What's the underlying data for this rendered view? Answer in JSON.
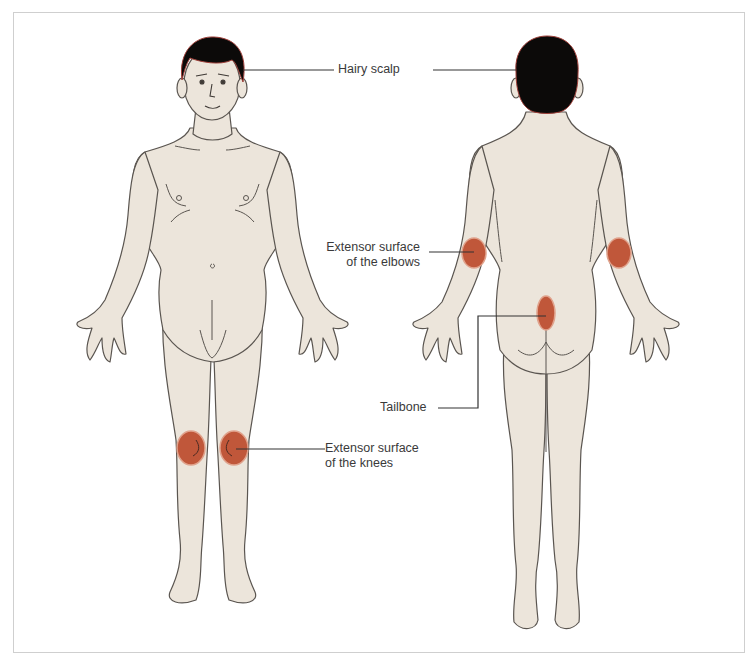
{
  "diagram": {
    "views": [
      {
        "id": "front",
        "name": "Front view"
      },
      {
        "id": "back",
        "name": "Back view"
      }
    ],
    "colors": {
      "skin": "#ece5db",
      "outline": "#5a5550",
      "hair": "#0c0a09",
      "hair_edge": "#a0403a",
      "lesion": "#c0573a",
      "lesion_edge": "#e0a28c",
      "leader": "#333333",
      "text": "#3a3a3a",
      "border": "#cfcfcf"
    },
    "labels": {
      "scalp": {
        "text": "Hairy scalp"
      },
      "elbows": {
        "line1": "Extensor surface",
        "line2": "of the elbows"
      },
      "tailbone": {
        "text": "Tailbone"
      },
      "knees": {
        "line1": "Extensor surface",
        "line2": "of the knees"
      }
    },
    "lesions": [
      {
        "site": "left-knee-front",
        "cx": 191,
        "cy": 448,
        "rx": 14,
        "ry": 17
      },
      {
        "site": "right-knee-front",
        "cx": 234,
        "cy": 448,
        "rx": 14,
        "ry": 17
      },
      {
        "site": "left-elbow-back",
        "cx": 474,
        "cy": 253,
        "rx": 12,
        "ry": 15
      },
      {
        "site": "right-elbow-back",
        "cx": 619,
        "cy": 253,
        "rx": 12,
        "ry": 15
      },
      {
        "site": "tailbone-back",
        "cx": 546,
        "cy": 313,
        "rx": 9,
        "ry": 17
      }
    ]
  }
}
